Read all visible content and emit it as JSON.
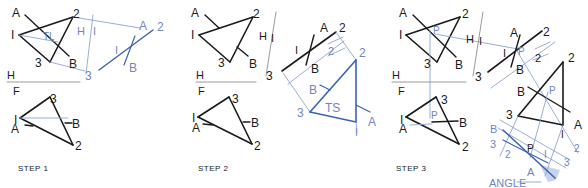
{
  "colors": {
    "black": "#1a1a1a",
    "blue": "#3a62b5",
    "light_blue": "#8ea4cf",
    "label_blue": "#6f86c2",
    "fill_blue": "#c7d3ea",
    "grey": "#9a9a9a"
  },
  "steps": [
    {
      "label": "STEP 1",
      "x": 18,
      "y": 172
    },
    {
      "label": "STEP 2",
      "x": 198,
      "y": 172
    },
    {
      "label": "STEP 3",
      "x": 396,
      "y": 172
    }
  ],
  "lines": [
    {
      "c": "black",
      "w": 1.6,
      "p": [
        19,
        35,
        73,
        17
      ]
    },
    {
      "c": "black",
      "w": 1.6,
      "p": [
        73,
        17,
        50,
        62
      ]
    },
    {
      "c": "black",
      "w": 1.6,
      "p": [
        50,
        62,
        19,
        35
      ]
    },
    {
      "c": "black",
      "w": 1.4,
      "p": [
        25,
        15,
        69,
        56
      ]
    },
    {
      "c": "light_blue",
      "w": 0.9,
      "p": [
        19,
        35,
        58,
        42
      ]
    },
    {
      "c": "light_blue",
      "w": 0.9,
      "p": [
        73,
        17,
        140,
        28
      ]
    },
    {
      "c": "light_blue",
      "w": 0.9,
      "p": [
        50,
        62,
        85,
        71
      ]
    },
    {
      "c": "light_blue",
      "w": 0.9,
      "p": [
        93,
        15,
        86,
        74
      ]
    },
    {
      "c": "blue",
      "w": 1.4,
      "p": [
        99,
        70,
        153,
        30
      ]
    },
    {
      "c": "blue",
      "w": 1.2,
      "p": [
        135,
        36,
        124,
        65
      ]
    },
    {
      "c": "grey",
      "w": 1,
      "p": [
        7,
        82,
        80,
        82
      ]
    },
    {
      "c": "black",
      "w": 1.6,
      "p": [
        20,
        118,
        50,
        97
      ]
    },
    {
      "c": "black",
      "w": 1.6,
      "p": [
        50,
        97,
        73,
        145
      ]
    },
    {
      "c": "black",
      "w": 1.6,
      "p": [
        73,
        145,
        20,
        118
      ]
    },
    {
      "c": "light_blue",
      "w": 0.9,
      "p": [
        20,
        118,
        68,
        118
      ]
    },
    {
      "c": "black",
      "w": 1.3,
      "p": [
        25,
        125,
        33,
        126
      ]
    },
    {
      "c": "black",
      "w": 1.3,
      "p": [
        65,
        123,
        72,
        123
      ]
    },
    {
      "c": "black",
      "w": 1.6,
      "p": [
        199,
        35,
        253,
        17
      ]
    },
    {
      "c": "black",
      "w": 1.6,
      "p": [
        253,
        17,
        230,
        62
      ]
    },
    {
      "c": "black",
      "w": 1.6,
      "p": [
        230,
        62,
        199,
        35
      ]
    },
    {
      "c": "black",
      "w": 1.4,
      "p": [
        205,
        15,
        219,
        28
      ]
    },
    {
      "c": "black",
      "w": 1.4,
      "p": [
        237,
        47,
        248,
        56
      ]
    },
    {
      "c": "grey",
      "w": 1,
      "p": [
        276,
        12,
        266,
        76
      ]
    },
    {
      "c": "grey",
      "w": 1,
      "p": [
        196,
        82,
        256,
        82
      ]
    },
    {
      "c": "black",
      "w": 1.6,
      "p": [
        282,
        71,
        336,
        32
      ]
    },
    {
      "c": "black",
      "w": 1.4,
      "p": [
        314,
        35,
        306,
        65
      ]
    },
    {
      "c": "light_blue",
      "w": 0.9,
      "p": [
        283,
        73,
        310,
        112
      ]
    },
    {
      "c": "light_blue",
      "w": 0.9,
      "p": [
        336,
        32,
        356,
        60
      ]
    },
    {
      "c": "light_blue",
      "w": 0.9,
      "p": [
        288,
        84,
        344,
        41
      ]
    },
    {
      "c": "light_blue",
      "w": 0.9,
      "p": [
        328,
        44,
        343,
        37
      ]
    },
    {
      "c": "light_blue",
      "w": 0.9,
      "p": [
        328,
        56,
        345,
        48
      ]
    },
    {
      "c": "blue",
      "w": 1.6,
      "p": [
        356,
        60,
        356,
        122
      ]
    },
    {
      "c": "blue",
      "w": 1.6,
      "p": [
        356,
        122,
        310,
        112
      ]
    },
    {
      "c": "blue",
      "w": 1.6,
      "p": [
        310,
        112,
        356,
        60
      ]
    },
    {
      "c": "blue",
      "w": 1.2,
      "p": [
        320,
        85,
        330,
        90
      ]
    },
    {
      "c": "blue",
      "w": 1.2,
      "p": [
        356,
        105,
        370,
        112
      ]
    },
    {
      "c": "light_blue",
      "w": 0.9,
      "p": [
        356,
        122,
        357,
        133
      ]
    },
    {
      "c": "black",
      "w": 1.6,
      "p": [
        198,
        117,
        229,
        97
      ]
    },
    {
      "c": "black",
      "w": 1.6,
      "p": [
        229,
        97,
        252,
        144
      ]
    },
    {
      "c": "black",
      "w": 1.6,
      "p": [
        252,
        144,
        198,
        117
      ]
    },
    {
      "c": "black",
      "w": 1.3,
      "p": [
        203,
        124,
        213,
        125
      ]
    },
    {
      "c": "black",
      "w": 1.3,
      "p": [
        243,
        122,
        250,
        122
      ]
    },
    {
      "c": "black",
      "w": 1.6,
      "p": [
        406,
        35,
        460,
        17
      ]
    },
    {
      "c": "black",
      "w": 1.6,
      "p": [
        460,
        17,
        437,
        62
      ]
    },
    {
      "c": "black",
      "w": 1.6,
      "p": [
        437,
        62,
        406,
        35
      ]
    },
    {
      "c": "black",
      "w": 1.4,
      "p": [
        413,
        15,
        456,
        57
      ]
    },
    {
      "c": "light_blue",
      "w": 0.9,
      "p": [
        430,
        30,
        430,
        118
      ]
    },
    {
      "c": "light_blue",
      "w": 0.9,
      "p": [
        435,
        34,
        518,
        49
      ]
    },
    {
      "c": "grey",
      "w": 1,
      "p": [
        483,
        12,
        473,
        76
      ]
    },
    {
      "c": "grey",
      "w": 1,
      "p": [
        392,
        82,
        466,
        82
      ]
    },
    {
      "c": "black",
      "w": 1.6,
      "p": [
        488,
        72,
        542,
        31
      ]
    },
    {
      "c": "black",
      "w": 1.4,
      "p": [
        520,
        35,
        511,
        67
      ]
    },
    {
      "c": "light_blue",
      "w": 0.9,
      "p": [
        517,
        51,
        578,
        153
      ]
    },
    {
      "c": "light_blue",
      "w": 0.9,
      "p": [
        491,
        88,
        555,
        42
      ]
    },
    {
      "c": "light_blue",
      "w": 0.9,
      "p": [
        535,
        49,
        550,
        42
      ]
    },
    {
      "c": "light_blue",
      "w": 0.9,
      "p": [
        533,
        60,
        548,
        54
      ]
    },
    {
      "c": "black",
      "w": 1.6,
      "p": [
        563,
        62,
        563,
        125
      ]
    },
    {
      "c": "black",
      "w": 1.6,
      "p": [
        563,
        125,
        518,
        116
      ]
    },
    {
      "c": "black",
      "w": 1.6,
      "p": [
        518,
        116,
        563,
        62
      ]
    },
    {
      "c": "black",
      "w": 1.4,
      "p": [
        528,
        87,
        570,
        112
      ]
    },
    {
      "c": "light_blue",
      "w": 0.9,
      "p": [
        518,
        116,
        500,
        156
      ]
    },
    {
      "c": "light_blue",
      "w": 0.9,
      "p": [
        563,
        125,
        545,
        176
      ]
    },
    {
      "c": "light_blue",
      "w": 0.9,
      "p": [
        548,
        92,
        530,
        158
      ]
    },
    {
      "c": "light_blue",
      "w": 0.9,
      "p": [
        500,
        120,
        570,
        160
      ]
    },
    {
      "c": "light_blue",
      "w": 0.9,
      "p": [
        498,
        128,
        566,
        168
      ]
    },
    {
      "c": "blue",
      "w": 1.5,
      "p": [
        503,
        130,
        555,
        178
      ]
    },
    {
      "c": "blue",
      "w": 1.2,
      "p": [
        503,
        140,
        548,
        163
      ]
    },
    {
      "c": "light_blue",
      "w": 0.9,
      "p": [
        541,
        182,
        517,
        182
      ]
    },
    {
      "c": "black",
      "w": 1.6,
      "p": [
        406,
        117,
        436,
        97
      ]
    },
    {
      "c": "black",
      "w": 1.6,
      "p": [
        436,
        97,
        459,
        144
      ]
    },
    {
      "c": "black",
      "w": 1.6,
      "p": [
        459,
        144,
        406,
        117
      ]
    },
    {
      "c": "black",
      "w": 1.5,
      "p": [
        432,
        122,
        458,
        121
      ]
    },
    {
      "c": "light_blue",
      "w": 0.9,
      "p": [
        410,
        125,
        432,
        124
      ]
    }
  ],
  "polygons": [
    {
      "c": "fill_blue",
      "pts": "540,165 560,170 556,180 548,182"
    }
  ],
  "labels": [
    {
      "t": "A",
      "x": 12,
      "y": 17,
      "c": "black",
      "s": 12
    },
    {
      "t": "2",
      "x": 73,
      "y": 18,
      "c": "black",
      "s": 12
    },
    {
      "t": "I",
      "x": 11,
      "y": 39,
      "c": "black",
      "s": 12
    },
    {
      "t": "TL",
      "x": 43,
      "y": 40,
      "c": "label_blue",
      "s": 10
    },
    {
      "t": "3",
      "x": 35,
      "y": 67,
      "c": "black",
      "s": 12
    },
    {
      "t": "B",
      "x": 69,
      "y": 68,
      "c": "black",
      "s": 12
    },
    {
      "t": "H",
      "x": 77,
      "y": 35,
      "c": "label_blue",
      "s": 11
    },
    {
      "t": "I",
      "x": 93,
      "y": 35,
      "c": "label_blue",
      "s": 11
    },
    {
      "t": "3",
      "x": 85,
      "y": 80,
      "c": "label_blue",
      "s": 12
    },
    {
      "t": "A",
      "x": 139,
      "y": 30,
      "c": "label_blue",
      "s": 12
    },
    {
      "t": "2",
      "x": 157,
      "y": 31,
      "c": "label_blue",
      "s": 12
    },
    {
      "t": "I",
      "x": 115,
      "y": 54,
      "c": "label_blue",
      "s": 11
    },
    {
      "t": "B",
      "x": 129,
      "y": 72,
      "c": "label_blue",
      "s": 12
    },
    {
      "t": "H",
      "x": 7,
      "y": 79,
      "c": "black",
      "s": 11
    },
    {
      "t": "F",
      "x": 13,
      "y": 95,
      "c": "black",
      "s": 11
    },
    {
      "t": "3",
      "x": 50,
      "y": 103,
      "c": "black",
      "s": 12
    },
    {
      "t": "I",
      "x": 14,
      "y": 124,
      "c": "black",
      "s": 12
    },
    {
      "t": "A",
      "x": 11,
      "y": 133,
      "c": "black",
      "s": 12
    },
    {
      "t": "B",
      "x": 72,
      "y": 128,
      "c": "black",
      "s": 12
    },
    {
      "t": "2",
      "x": 75,
      "y": 150,
      "c": "black",
      "s": 12
    },
    {
      "t": "A",
      "x": 191,
      "y": 17,
      "c": "black",
      "s": 12
    },
    {
      "t": "2",
      "x": 253,
      "y": 18,
      "c": "black",
      "s": 12
    },
    {
      "t": "I",
      "x": 191,
      "y": 39,
      "c": "black",
      "s": 12
    },
    {
      "t": "3",
      "x": 218,
      "y": 67,
      "c": "black",
      "s": 12
    },
    {
      "t": "B",
      "x": 249,
      "y": 68,
      "c": "black",
      "s": 12
    },
    {
      "t": "H",
      "x": 259,
      "y": 40,
      "c": "black",
      "s": 11
    },
    {
      "t": "I",
      "x": 271,
      "y": 42,
      "c": "black",
      "s": 11
    },
    {
      "t": "3",
      "x": 266,
      "y": 80,
      "c": "black",
      "s": 12
    },
    {
      "t": "A",
      "x": 320,
      "y": 32,
      "c": "black",
      "s": 12
    },
    {
      "t": "2",
      "x": 339,
      "y": 32,
      "c": "black",
      "s": 12
    },
    {
      "t": "I",
      "x": 295,
      "y": 54,
      "c": "black",
      "s": 11
    },
    {
      "t": "B",
      "x": 311,
      "y": 73,
      "c": "black",
      "s": 12
    },
    {
      "t": "2",
      "x": 328,
      "y": 55,
      "c": "label_blue",
      "s": 11
    },
    {
      "t": "2",
      "x": 359,
      "y": 57,
      "c": "label_blue",
      "s": 12
    },
    {
      "t": "B",
      "x": 309,
      "y": 94,
      "c": "label_blue",
      "s": 12
    },
    {
      "t": "TS",
      "x": 325,
      "y": 112,
      "c": "label_blue",
      "s": 12
    },
    {
      "t": "3",
      "x": 297,
      "y": 117,
      "c": "label_blue",
      "s": 12
    },
    {
      "t": "A",
      "x": 368,
      "y": 126,
      "c": "label_blue",
      "s": 12
    },
    {
      "t": "I",
      "x": 355,
      "y": 136,
      "c": "label_blue",
      "s": 10
    },
    {
      "t": "H",
      "x": 196,
      "y": 79,
      "c": "black",
      "s": 11
    },
    {
      "t": "F",
      "x": 198,
      "y": 95,
      "c": "black",
      "s": 11
    },
    {
      "t": "3",
      "x": 232,
      "y": 103,
      "c": "black",
      "s": 12
    },
    {
      "t": "I",
      "x": 192,
      "y": 122,
      "c": "black",
      "s": 12
    },
    {
      "t": "A",
      "x": 192,
      "y": 132,
      "c": "black",
      "s": 12
    },
    {
      "t": "B",
      "x": 251,
      "y": 127,
      "c": "black",
      "s": 12
    },
    {
      "t": "2",
      "x": 254,
      "y": 150,
      "c": "black",
      "s": 12
    },
    {
      "t": "A",
      "x": 399,
      "y": 17,
      "c": "black",
      "s": 12
    },
    {
      "t": "2",
      "x": 462,
      "y": 18,
      "c": "black",
      "s": 12
    },
    {
      "t": "I",
      "x": 399,
      "y": 39,
      "c": "black",
      "s": 12
    },
    {
      "t": "P",
      "x": 433,
      "y": 34,
      "c": "label_blue",
      "s": 10
    },
    {
      "t": "3",
      "x": 424,
      "y": 68,
      "c": "black",
      "s": 12
    },
    {
      "t": "B",
      "x": 455,
      "y": 69,
      "c": "black",
      "s": 12
    },
    {
      "t": "H",
      "x": 466,
      "y": 43,
      "c": "black",
      "s": 11
    },
    {
      "t": "I",
      "x": 479,
      "y": 45,
      "c": "black",
      "s": 11
    },
    {
      "t": "3",
      "x": 475,
      "y": 81,
      "c": "black",
      "s": 12
    },
    {
      "t": "A",
      "x": 510,
      "y": 37,
      "c": "black",
      "s": 12
    },
    {
      "t": "2",
      "x": 543,
      "y": 36,
      "c": "black",
      "s": 12
    },
    {
      "t": "I",
      "x": 503,
      "y": 57,
      "c": "black",
      "s": 11
    },
    {
      "t": "P",
      "x": 518,
      "y": 55,
      "c": "label_blue",
      "s": 10
    },
    {
      "t": "B",
      "x": 516,
      "y": 74,
      "c": "black",
      "s": 12
    },
    {
      "t": "2",
      "x": 535,
      "y": 62,
      "c": "black",
      "s": 11
    },
    {
      "t": "2",
      "x": 568,
      "y": 62,
      "c": "black",
      "s": 12
    },
    {
      "t": "B",
      "x": 517,
      "y": 96,
      "c": "black",
      "s": 12
    },
    {
      "t": "P",
      "x": 549,
      "y": 94,
      "c": "label_blue",
      "s": 10
    },
    {
      "t": "3",
      "x": 506,
      "y": 119,
      "c": "black",
      "s": 12
    },
    {
      "t": "A",
      "x": 574,
      "y": 129,
      "c": "black",
      "s": 12
    },
    {
      "t": "I",
      "x": 561,
      "y": 138,
      "c": "black",
      "s": 10
    },
    {
      "t": "B",
      "x": 490,
      "y": 133,
      "c": "label_blue",
      "s": 11
    },
    {
      "t": "3",
      "x": 490,
      "y": 148,
      "c": "label_blue",
      "s": 11
    },
    {
      "t": "2",
      "x": 505,
      "y": 158,
      "c": "label_blue",
      "s": 10
    },
    {
      "t": "P",
      "x": 527,
      "y": 152,
      "c": "black",
      "s": 10
    },
    {
      "t": "I",
      "x": 544,
      "y": 158,
      "c": "label_blue",
      "s": 10
    },
    {
      "t": "A",
      "x": 527,
      "y": 176,
      "c": "label_blue",
      "s": 11
    },
    {
      "t": "3",
      "x": 564,
      "y": 166,
      "c": "label_blue",
      "s": 10
    },
    {
      "t": "2",
      "x": 574,
      "y": 152,
      "c": "label_blue",
      "s": 10
    },
    {
      "t": "ANGLE",
      "x": 489,
      "y": 187,
      "c": "label_blue",
      "s": 11
    },
    {
      "t": "H",
      "x": 392,
      "y": 79,
      "c": "black",
      "s": 11
    },
    {
      "t": "F",
      "x": 398,
      "y": 95,
      "c": "black",
      "s": 11
    },
    {
      "t": "3",
      "x": 441,
      "y": 104,
      "c": "black",
      "s": 12
    },
    {
      "t": "P",
      "x": 431,
      "y": 119,
      "c": "label_blue",
      "s": 10
    },
    {
      "t": "I",
      "x": 400,
      "y": 124,
      "c": "black",
      "s": 12
    },
    {
      "t": "A",
      "x": 399,
      "y": 133,
      "c": "black",
      "s": 12
    },
    {
      "t": "B",
      "x": 459,
      "y": 127,
      "c": "black",
      "s": 12
    },
    {
      "t": "2",
      "x": 462,
      "y": 151,
      "c": "black",
      "s": 12
    }
  ]
}
